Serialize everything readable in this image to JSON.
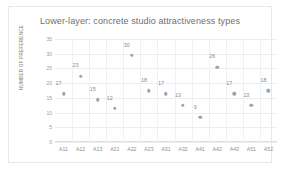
{
  "chart_data": {
    "type": "scatter",
    "title": "Lower-layer: concrete studio attractiveness types",
    "xlabel": "",
    "ylabel": "NUMBER OF PREFERENCE",
    "categories": [
      "A11",
      "A12",
      "A13",
      "A21",
      "A22",
      "A23",
      "A31",
      "A32",
      "A41",
      "A42",
      "A43",
      "A51",
      "A52"
    ],
    "values": [
      17,
      23,
      15,
      12,
      30,
      18,
      17,
      13,
      9,
      26,
      17,
      13,
      18
    ],
    "data_labels": [
      "17",
      "23",
      "15",
      "12",
      "30",
      "18",
      "17",
      "13",
      "9",
      "26",
      "17",
      "13",
      "18"
    ],
    "ylim": [
      0,
      35
    ],
    "yticks": [
      "0",
      "5",
      "10",
      "15",
      "20",
      "25",
      "30",
      "35"
    ],
    "grid": true,
    "legend": false,
    "marker_color": "#9aa4b4",
    "label_color": "#8a8a8a",
    "gridline_color": "#ededed"
  }
}
